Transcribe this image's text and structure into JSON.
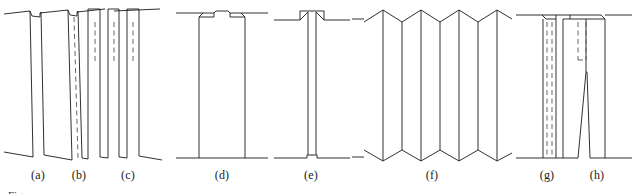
{
  "figure": {
    "type": "technical-line-diagram",
    "background_color": "#ffffff",
    "line_color": "#1a1a1a",
    "dashed_line_color": "#555555",
    "stroke_width": 0.9,
    "caption_stub": "Fig.",
    "panels": [
      {
        "id": "a",
        "label": "(a)",
        "label_x": 38,
        "label_y": 176,
        "kind": "inclined-lamella-with-top-notch",
        "has_dashed_interior": false
      },
      {
        "id": "b",
        "label": "(b)",
        "label_x": 79,
        "label_y": 176,
        "kind": "inclined-lamella-with-top-notch",
        "has_dashed_interior": true
      },
      {
        "id": "c",
        "label": "(c)",
        "label_x": 128,
        "label_y": 176,
        "kind": "inclined-lamella-pair-with-short-dashes",
        "has_dashed_interior": true
      },
      {
        "id": "d",
        "label": "(d)",
        "label_x": 222,
        "label_y": 176,
        "kind": "wide-upright-plate-two-top-notches",
        "has_dashed_interior": false
      },
      {
        "id": "e",
        "label": "(e)",
        "label_x": 311,
        "label_y": 176,
        "kind": "narrow-stem-with-flared-top",
        "has_dashed_interior": false
      },
      {
        "id": "f",
        "label": "(f)",
        "label_x": 432,
        "label_y": 176,
        "kind": "accordion-zigzag-lamellae",
        "has_dashed_interior": false
      },
      {
        "id": "g",
        "label": "(g)",
        "label_x": 547,
        "label_y": 176,
        "kind": "upright-plate-with-dashed-core",
        "has_dashed_interior": true
      },
      {
        "id": "h",
        "label": "(h)",
        "label_x": 597,
        "label_y": 176,
        "kind": "upright-plate-with-tapered-split",
        "has_dashed_interior": true
      }
    ],
    "surfaces": {
      "top_baseline_y": 20,
      "bottom_baseline_y": 160,
      "note": "Free surfaces drawn as slightly inclined straight segments entering and leaving each panel"
    }
  }
}
